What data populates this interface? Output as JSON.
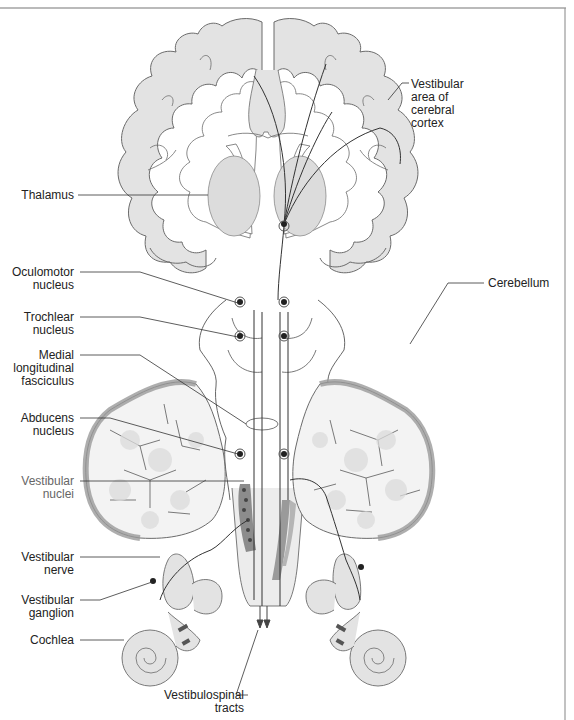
{
  "diagram": {
    "type": "anatomical-pathway",
    "colors": {
      "tissue_fill": "#e3e3e3",
      "outline": "#6b6b6b",
      "pathway_line": "#333333",
      "cerebellum_cortex": "#9a9a9a",
      "vestibular_nuclei": "#8c8c8c",
      "frame": "#777777"
    },
    "labels": {
      "vestibular_cortex": [
        "Vestibular",
        "area of",
        "cerebral",
        "cortex"
      ],
      "thalamus": [
        "Thalamus"
      ],
      "oculomotor": [
        "Oculomotor",
        "nucleus"
      ],
      "trochlear": [
        "Trochlear",
        "nucleus"
      ],
      "mlf": [
        "Medial",
        "longitudinal",
        "fasciculus"
      ],
      "cerebellum": [
        "Cerebellum"
      ],
      "abducens": [
        "Abducens",
        "nucleus"
      ],
      "vestibular_nuclei": [
        "Vestibular",
        "nuclei"
      ],
      "vestibular_nerve": [
        "Vestibular",
        "nerve"
      ],
      "vestibular_ganglion": [
        "Vestibular",
        "ganglion"
      ],
      "cochlea": [
        "Cochlea"
      ],
      "vestibulospinal": [
        "Vestibulospinal",
        "tracts"
      ]
    }
  }
}
